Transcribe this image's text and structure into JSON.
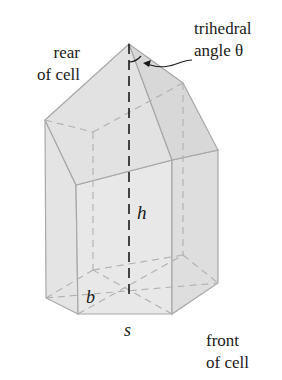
{
  "labels": {
    "rear_line1": "rear",
    "rear_line2": "of cell",
    "trihedral_line1": "trihedral",
    "trihedral_line2": "angle θ",
    "height": "h",
    "base_b": "b",
    "side_s": "s",
    "front_line1": "front",
    "front_line2": "of cell"
  },
  "colors": {
    "face_fill": "#e6e6e6",
    "face_fill_dark": "#dcdcdc",
    "edge": "#a8a8a8",
    "hidden_edge": "#b4b4b4",
    "axis": "#1a1a1a",
    "text": "#1a1a1a"
  }
}
